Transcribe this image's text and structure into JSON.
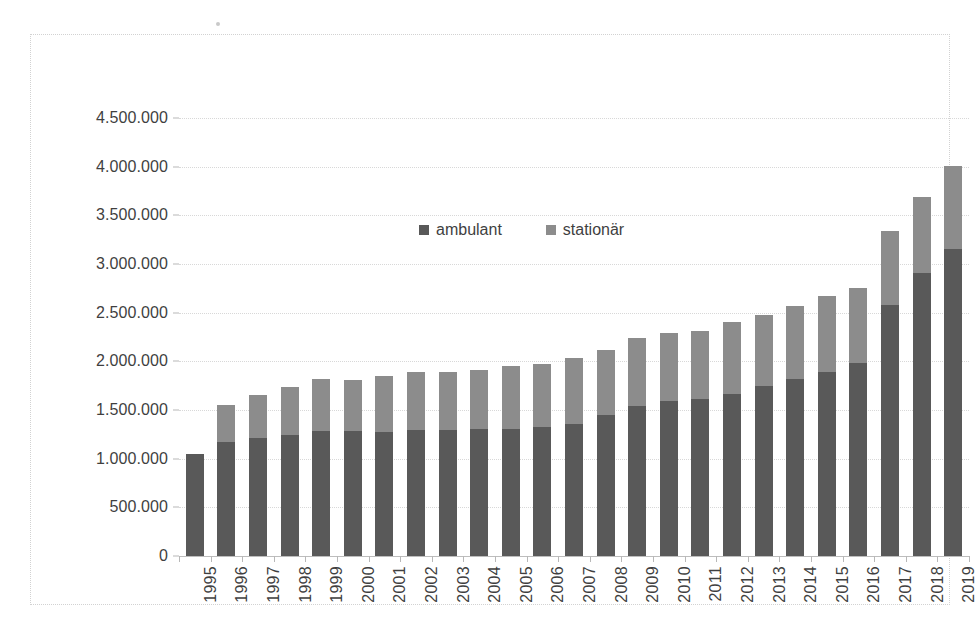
{
  "chart_data": {
    "type": "bar",
    "subtype": "stacked",
    "title": "",
    "xlabel": "",
    "ylabel": "",
    "ylim": [
      0,
      4500000
    ],
    "ytick_step": 500000,
    "grid": true,
    "legend_position": "top-center",
    "categories": [
      "1995",
      "1996",
      "1997",
      "1998",
      "1999",
      "2000",
      "2001",
      "2002",
      "2003",
      "2004",
      "2005",
      "2006",
      "2007",
      "2008",
      "2009",
      "2010",
      "2011",
      "2012",
      "2013",
      "2014",
      "2015",
      "2016",
      "2017",
      "2018",
      "2019"
    ],
    "ytick_labels": [
      "4.500.000",
      "4.000.000",
      "3.500.000",
      "3.000.000",
      "2.500.000",
      "2.000.000",
      "1.500.000",
      "1.000.000",
      "500.000",
      "0"
    ],
    "ytick_values": [
      4500000,
      4000000,
      3500000,
      3000000,
      2500000,
      2000000,
      1500000,
      1000000,
      500000,
      0
    ],
    "series": [
      {
        "name": "ambulant",
        "color": "#595959",
        "values": [
          1050000,
          1170000,
          1210000,
          1240000,
          1285000,
          1280000,
          1275000,
          1290000,
          1295000,
          1300000,
          1310000,
          1325000,
          1360000,
          1450000,
          1540000,
          1590000,
          1610000,
          1665000,
          1750000,
          1815000,
          1895000,
          1985000,
          2575000,
          2910000,
          3150000
        ]
      },
      {
        "name": "stationär",
        "color": "#8c8c8c",
        "values": [
          0,
          380000,
          445000,
          495000,
          530000,
          530000,
          570000,
          600000,
          600000,
          615000,
          640000,
          650000,
          675000,
          665000,
          695000,
          700000,
          700000,
          735000,
          730000,
          755000,
          775000,
          765000,
          765000,
          780000,
          855000
        ]
      }
    ],
    "totals": [
      1050000,
      1550000,
      1655000,
      1735000,
      1815000,
      1810000,
      1845000,
      1890000,
      1895000,
      1915000,
      1950000,
      1975000,
      2035000,
      2115000,
      2235000,
      2290000,
      2310000,
      2400000,
      2480000,
      2570000,
      2670000,
      2750000,
      3340000,
      3690000,
      4005000
    ]
  },
  "legend": {
    "items": [
      {
        "label": "ambulant",
        "color": "#595959"
      },
      {
        "label": "stationär",
        "color": "#8c8c8c"
      }
    ]
  },
  "colors": {
    "ambulant": "#595959",
    "stationaer": "#8c8c8c",
    "gridline": "#d8d8d8",
    "axis": "#bdbdbd",
    "frame": "#d2d2d2",
    "text": "#3f3f3f",
    "background": "#ffffff"
  }
}
